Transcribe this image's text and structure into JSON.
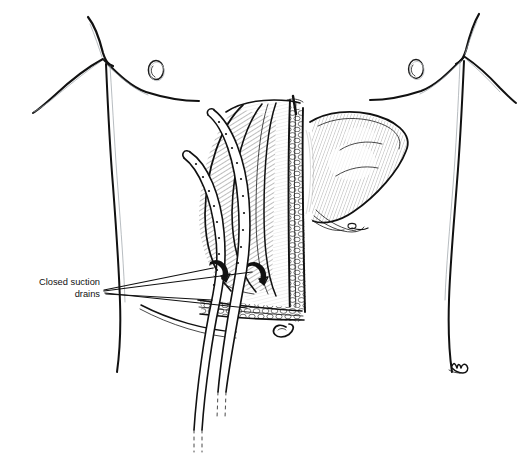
{
  "figure": {
    "domain_type": "medical-line-illustration",
    "background_color": "#ffffff",
    "ink_color": "#111111",
    "secondary_ink_color": "#9aa0a6",
    "canvas": {
      "width": 517,
      "height": 456
    }
  },
  "annotations": {
    "drain_label": {
      "line1": "Closed suction",
      "line2": "drains",
      "text_anchor": "end",
      "x": 100,
      "y_line1": 285,
      "y_line2": 296,
      "font_size_px": 9.3,
      "leader_count": 2,
      "leader_origin_x": 104,
      "leader_origin_y": 290
    }
  },
  "anatomy": {
    "parts": [
      {
        "name": "left-chest-contour",
        "label": "Left chest / breast outline"
      },
      {
        "name": "right-chest-contour",
        "label": "Right chest / breast outline"
      },
      {
        "name": "left-nipple",
        "label": "Left nipple"
      },
      {
        "name": "right-nipple",
        "label": "Right nipple"
      },
      {
        "name": "left-flank-contour",
        "label": "Left flank / torso side"
      },
      {
        "name": "right-flank-contour",
        "label": "Right flank / torso side"
      },
      {
        "name": "umbilicus",
        "label": "Umbilicus"
      },
      {
        "name": "liver",
        "label": "Liver"
      },
      {
        "name": "retracted-tissue-flap",
        "label": "Retracted abdominal wall flap"
      },
      {
        "name": "incision-edge-fat",
        "label": "Cut edge of abdominal wall with subcutaneous fat"
      },
      {
        "name": "wound-bed",
        "label": "Open wound bed"
      },
      {
        "name": "drain-tube-upper",
        "label": "Upper closed suction drain"
      },
      {
        "name": "drain-tube-lower",
        "label": "Lower closed suction drain"
      },
      {
        "name": "drain-exit-upper",
        "label": "Upper drain exit site"
      },
      {
        "name": "drain-exit-lower",
        "label": "Lower drain exit site"
      },
      {
        "name": "artist-signature",
        "label": "Artist signature mark"
      }
    ]
  },
  "drains": {
    "count": 2,
    "feature": "fenestrated perforations along tubing",
    "tips": "dashed cut ends at tube terminations"
  }
}
